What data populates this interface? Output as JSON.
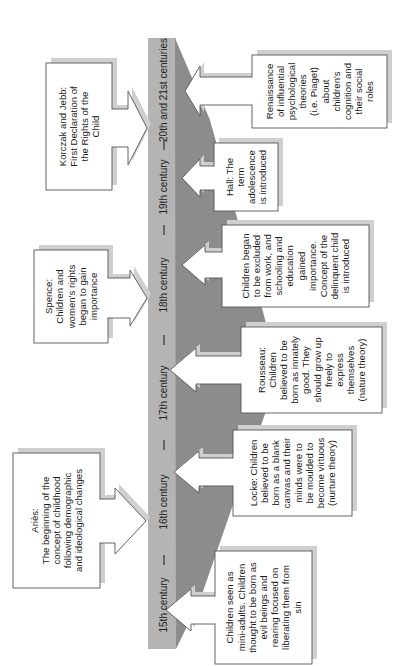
{
  "colors": {
    "band": "#b4b4b4",
    "wedge": "#8c8c8c",
    "shadow": "#cfcfcf",
    "box_fill": "#ffffff",
    "box_stroke": "#555555",
    "tick": "#333333"
  },
  "timeline": {
    "centuries": [
      {
        "label": "20th and 21st centuries",
        "cy": 90
      },
      {
        "label": "19th century",
        "cy": 187
      },
      {
        "label": "18th century",
        "cy": 285
      },
      {
        "label": "17th century",
        "cy": 393
      },
      {
        "label": "16th century",
        "cy": 502
      },
      {
        "label": "15th century",
        "cy": 605
      }
    ],
    "ticks": [
      145,
      230,
      340,
      445,
      560
    ]
  },
  "left_events": [
    {
      "id": "korczak-jebb",
      "lines": [
        "Korczak and Jebb:",
        "First Declaration of",
        "the Rights of the",
        "Child"
      ],
      "box": {
        "x": 46,
        "y": 63,
        "w": 66,
        "h": 127
      },
      "arrow": {
        "tip": 147,
        "cy": 128,
        "bodyHalf": 19,
        "headHalf": 37,
        "headStart": 128
      }
    },
    {
      "id": "spence",
      "lines": [
        "Spence:",
        "Children and",
        "women's rights",
        "began to gain",
        "importance"
      ],
      "box": {
        "x": 34,
        "y": 250,
        "w": 74,
        "h": 93
      },
      "arrow": {
        "tip": 147,
        "cy": 298,
        "bodyHalf": 20,
        "headHalf": 28,
        "headStart": 130
      }
    },
    {
      "id": "aries",
      "lines": [
        "Ariès:",
        "The beginning of the",
        "concept of childhood",
        "following demographic",
        "and ideological changes"
      ],
      "box": {
        "x": 13,
        "y": 453,
        "w": 87,
        "h": 135
      },
      "arrow": {
        "tip": 146,
        "cy": 521,
        "bodyHalf": 22,
        "headHalf": 33,
        "headStart": 115
      }
    }
  ],
  "right_events": [
    {
      "id": "renaissance",
      "lines": [
        "Renaissance",
        "of influential",
        "psychological",
        "theories",
        "(i.e. Piaget)",
        "about",
        "children's",
        "cognition and",
        "their social",
        "roles"
      ],
      "box": {
        "x": 252,
        "y": 55,
        "w": 135,
        "h": 73
      },
      "arrow": {
        "tip": 185,
        "cy": 91,
        "bodyHalf": 14,
        "headHalf": 25,
        "headStart": 200
      }
    },
    {
      "id": "hall",
      "lines": [
        "Hall: The",
        "term",
        "adolescence",
        "is introduced"
      ],
      "box": {
        "x": 214,
        "y": 143,
        "w": 64,
        "h": 68
      },
      "arrow": {
        "tip": 182,
        "cy": 178,
        "bodyHalf": 12,
        "headHalf": 19,
        "headStart": 200
      }
    },
    {
      "id": "exclusion-from-work",
      "lines": [
        "Children began",
        "to be excluded",
        "from work, and",
        "schooling and",
        "education",
        "gained",
        "importance.",
        "Concept of the",
        "delinquent child",
        "is introduced"
      ],
      "box": {
        "x": 222,
        "y": 225,
        "w": 147,
        "h": 82
      },
      "arrow": {
        "tip": 182,
        "cy": 265,
        "bodyHalf": 13,
        "headHalf": 20,
        "headStart": 205
      }
    },
    {
      "id": "rousseau",
      "lines": [
        "Rousseau:",
        "Children",
        "believed to be",
        "born as innately",
        "good. They",
        "should grow up",
        "freely to",
        "express",
        "themselves",
        "(nature theory)"
      ],
      "box": {
        "x": 241,
        "y": 327,
        "w": 141,
        "h": 86
      },
      "arrow": {
        "tip": 170,
        "cy": 370,
        "bodyHalf": 14,
        "headHalf": 22,
        "headStart": 196
      }
    },
    {
      "id": "locke",
      "lines": [
        "Locke: Children",
        "believed to be",
        "born as a blank",
        "canvas and their",
        "minds were to",
        "be moulded to",
        "become virtuous",
        "(nurture theory)"
      ],
      "box": {
        "x": 233,
        "y": 430,
        "w": 119,
        "h": 86
      },
      "arrow": {
        "tip": 174,
        "cy": 472,
        "bodyHalf": 14,
        "headHalf": 21,
        "headStart": 199
      }
    },
    {
      "id": "mini-adults",
      "lines": [
        "Children seen as",
        "mini-adults. Children",
        "thought to be born as",
        "evil beings and",
        "rearing focused on",
        "liberating them from",
        "sin"
      ],
      "box": {
        "x": 215,
        "y": 551,
        "w": 97,
        "h": 113
      },
      "arrow": {
        "tip": 166,
        "cy": 610,
        "bodyHalf": 14,
        "headHalf": 21,
        "headStart": 191
      }
    }
  ]
}
